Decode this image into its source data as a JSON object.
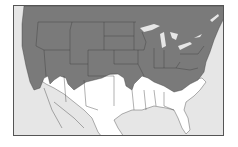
{
  "map": {
    "region": "United States and northern Mexico",
    "legend": [],
    "colors": {
      "shaded_range": "#7a7a7a",
      "unshaded_land": "#ffffff",
      "water": "#e6e6e6",
      "borders": "#3a3a3a",
      "frame": "#555555"
    },
    "shaded_description": "Northern and central US shaded gray",
    "unshaded_description": "Southern US and Mexico white"
  }
}
